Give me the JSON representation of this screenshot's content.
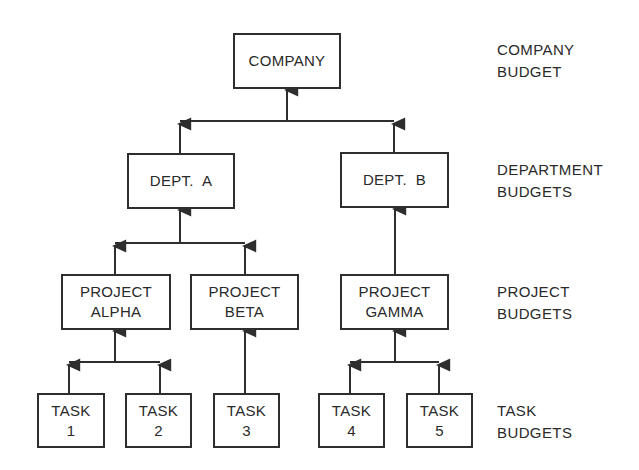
{
  "diagram": {
    "type": "hierarchy",
    "nodes": {
      "company": {
        "lines": [
          "COMPANY"
        ]
      },
      "dept_a": {
        "lines": [
          "DEPT.  A"
        ]
      },
      "dept_b": {
        "lines": [
          "DEPT.  B"
        ]
      },
      "project_alpha": {
        "lines": [
          "PROJECT",
          "ALPHA"
        ]
      },
      "project_beta": {
        "lines": [
          "PROJECT",
          "BETA"
        ]
      },
      "project_gamma": {
        "lines": [
          "PROJECT",
          "GAMMA"
        ]
      },
      "task_1": {
        "lines": [
          "TASK",
          "1"
        ]
      },
      "task_2": {
        "lines": [
          "TASK",
          "2"
        ]
      },
      "task_3": {
        "lines": [
          "TASK",
          "3"
        ]
      },
      "task_4": {
        "lines": [
          "TASK",
          "4"
        ]
      },
      "task_5": {
        "lines": [
          "TASK",
          "5"
        ]
      }
    },
    "edges": [
      {
        "from": "dept_a",
        "to": "company"
      },
      {
        "from": "dept_b",
        "to": "company"
      },
      {
        "from": "project_alpha",
        "to": "dept_a"
      },
      {
        "from": "project_beta",
        "to": "dept_a"
      },
      {
        "from": "project_gamma",
        "to": "dept_b"
      },
      {
        "from": "task_1",
        "to": "project_alpha"
      },
      {
        "from": "task_2",
        "to": "project_alpha"
      },
      {
        "from": "task_3",
        "to": "project_beta"
      },
      {
        "from": "task_4",
        "to": "project_gamma"
      },
      {
        "from": "task_5",
        "to": "project_gamma"
      }
    ],
    "level_labels": {
      "company": [
        "COMPANY",
        "BUDGET"
      ],
      "department": [
        "DEPARTMENT",
        "BUDGETS"
      ],
      "project": [
        "PROJECT",
        "BUDGETS"
      ],
      "task": [
        "TASK",
        "BUDGETS"
      ]
    },
    "caption_partial": "(cropped caption text, illegible)"
  },
  "colors": {
    "line": "#2e2e2e",
    "background": "#ffffff",
    "text": "#2a2a2a"
  }
}
